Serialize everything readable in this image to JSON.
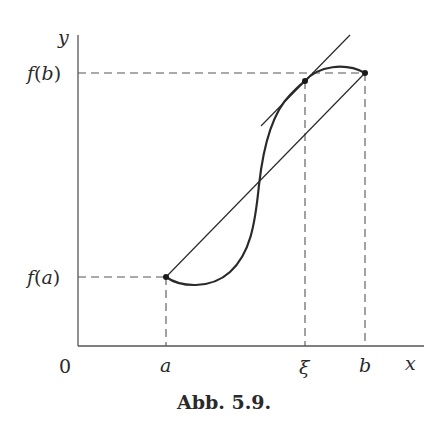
{
  "figure": {
    "caption": "Abb. 5.9.",
    "axes": {
      "y_label": "y",
      "x_label": "x",
      "origin_label": "0"
    },
    "y_ticks": [
      {
        "label": "f(b)",
        "label_parts": [
          "f",
          "(",
          "b",
          ")"
        ]
      },
      {
        "label": "f(a)",
        "label_parts": [
          "f",
          "(",
          "a",
          ")"
        ]
      }
    ],
    "x_ticks": [
      {
        "label": "a"
      },
      {
        "label": "ξ"
      },
      {
        "label": "b"
      }
    ],
    "elements": {
      "curve": "S-shaped function graph from (a, f(a)) to (b, f(b))",
      "chord": "secant line through (a, f(a)) and (b, f(b))",
      "tangent": "tangent line at ξ, parallel to chord",
      "points": [
        "(a, f(a))",
        "(ξ, f(ξ))",
        "(b, f(b))"
      ]
    },
    "colors": {
      "ink": "#2a2a2a",
      "axis": "#555555",
      "dashed": "#555555"
    }
  }
}
